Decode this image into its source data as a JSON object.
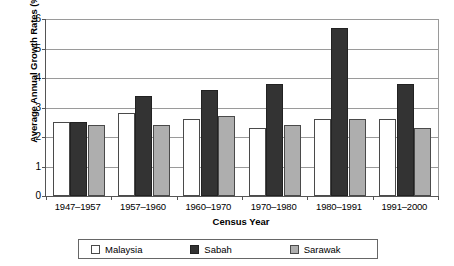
{
  "chart_data": {
    "type": "bar",
    "title": "",
    "xlabel": "Census Year",
    "ylabel": "Average Annual Growth Rates (%)",
    "ylim": [
      0,
      6
    ],
    "yticks": [
      0,
      1,
      2,
      3,
      4,
      5,
      6
    ],
    "ytick_labels": [
      "0",
      "1",
      "2",
      "3",
      "4",
      "5",
      "6"
    ],
    "grid": true,
    "legend_position": "bottom",
    "categories": [
      "1947–1957",
      "1957–1960",
      "1960–1970",
      "1970–1980",
      "1980–1991",
      "1991–2000"
    ],
    "series": [
      {
        "name": "Malaysia",
        "color": "#ffffff",
        "values": [
          2.5,
          2.8,
          2.6,
          2.3,
          2.6,
          2.6
        ]
      },
      {
        "name": "Sabah",
        "color": "#333333",
        "values": [
          2.5,
          3.4,
          3.6,
          3.8,
          5.7,
          3.8
        ]
      },
      {
        "name": "Sarawak",
        "color": "#aeaeae",
        "values": [
          2.4,
          2.4,
          2.7,
          2.4,
          2.6,
          2.3
        ]
      }
    ]
  },
  "axes": {
    "y_title": "Average Annual Growth Rates (%)",
    "x_title": "Census Year"
  },
  "legend": {
    "items": [
      {
        "label": "Malaysia",
        "swatch": "malaysia"
      },
      {
        "label": "Sabah",
        "swatch": "sabah"
      },
      {
        "label": "Sarawak",
        "swatch": "sarawak"
      }
    ]
  }
}
